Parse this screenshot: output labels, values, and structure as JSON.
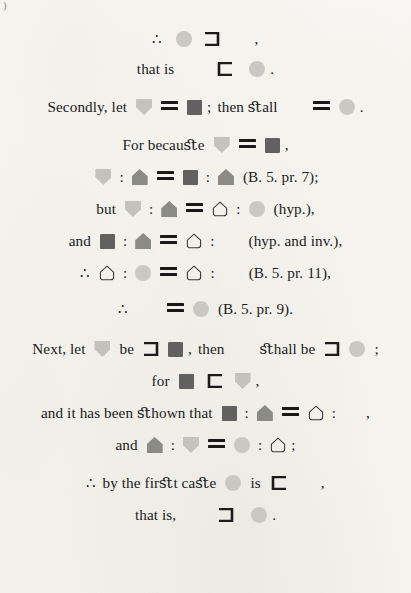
{
  "page": {
    "corner_mark": ")",
    "background_color": "#faf9f6",
    "ink_color": "#1b1b1b"
  },
  "symbol_colors": {
    "circle": "#c9c8c2",
    "diamond": "#6a6a68",
    "square": "#616160",
    "shield": "#c3c2bc",
    "house": "#8a8a86",
    "hollow_outline": "#3a3a38"
  },
  "symbol_names": {
    "circle": "circle-symbol",
    "diamond": "diamond-symbol",
    "square": "square-symbol",
    "shield": "shield-symbol",
    "house": "house-pentagon-symbol",
    "hollow": "hollow-pentagon-symbol",
    "supset": "superset-bracket-symbol",
    "subset": "subset-bracket-symbol",
    "equals": "equals-symbol",
    "therefore": "therefore-symbol"
  },
  "lines": {
    "l1": {
      "therefore": "∴",
      "comma": ","
    },
    "l2": {
      "that_is": "that is",
      "period": "."
    },
    "l3": {
      "secondly_let": "Secondly, let",
      "semicolon": ";",
      "then_shall": "then ﬆall",
      "period": "."
    },
    "l4": {
      "for_because": "For becauﬆe",
      "comma": ","
    },
    "l5": {
      "ref": "(B. 5. pr. 7);"
    },
    "l6": {
      "but": "but",
      "ref": "(hyp.),"
    },
    "l7": {
      "and": "and",
      "ref": "(hyp. and inv.),"
    },
    "l8": {
      "therefore": "∴",
      "ref": "(B. 5. pr. 11),"
    },
    "l9": {
      "therefore": "∴",
      "ref": "(B. 5. pr. 9)."
    },
    "l10": {
      "next_let": "Next, let",
      "be": "be",
      "comma": ",",
      "then": "then",
      "shall_be": "ﬆhall be",
      "semicolon": ";"
    },
    "l11": {
      "for": "for",
      "comma": ","
    },
    "l12": {
      "and_it_has_been_shown_that": "and it has been ﬆhown that",
      "comma": ","
    },
    "l13": {
      "and": "and",
      "semicolon": ";"
    },
    "l14": {
      "therefore": "∴",
      "by_the_first_case": "by the firﬆt caﬆe",
      "is": "is",
      "comma": ","
    },
    "l15": {
      "that_is": "that is,",
      "period": "."
    }
  }
}
